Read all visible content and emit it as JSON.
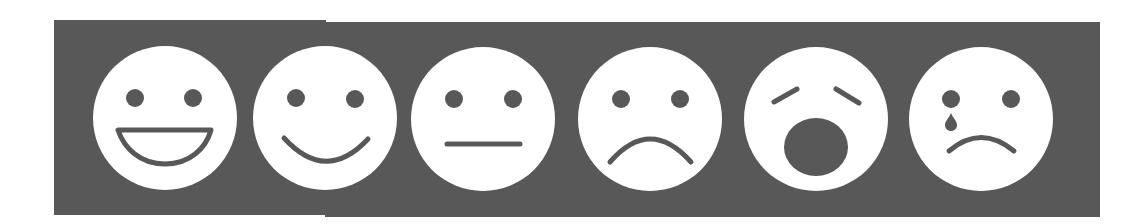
{
  "scale": {
    "title": "Emotion rating scale",
    "background_color": "#585858",
    "face_color": "#ffffff",
    "feature_color": "#585858",
    "faces": [
      {
        "label": "Very happy",
        "icon": "grinning-face-icon"
      },
      {
        "label": "Happy",
        "icon": "smiling-face-icon"
      },
      {
        "label": "Neutral",
        "icon": "neutral-face-icon"
      },
      {
        "label": "Sad",
        "icon": "frowning-face-icon"
      },
      {
        "label": "Distressed",
        "icon": "anguished-face-icon"
      },
      {
        "label": "Crying",
        "icon": "crying-face-icon"
      }
    ]
  }
}
